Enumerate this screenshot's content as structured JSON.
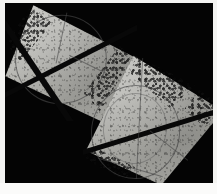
{
  "figure": {
    "domain": "natural-image",
    "width_px": 217,
    "height_px": 194
  },
  "colors": {
    "plate_background": "#f4f4f2",
    "field_background": "#040404",
    "specimen_light": "#c2c2bd",
    "specimen_mid": "#a9a9a4",
    "specimen_dark": "#8d8d88",
    "band_dark": "#080808",
    "outline_gray": "#4a4a4a",
    "caption_strip": "#fbfbfa"
  },
  "specimens": [
    {
      "id": "specimen-upper-left",
      "label": "Upper-left specimen",
      "shape": "kite",
      "bands": 2,
      "band_pattern": "crossing-x",
      "inner_structure": "circular-inclusion",
      "texture": "granular-speckled"
    },
    {
      "id": "specimen-lower-right",
      "label": "Lower-right specimen",
      "shape": "kite",
      "bands": 1,
      "band_pattern": "single-diagonal",
      "inner_structure": "circular-inclusion",
      "texture": "granular-speckled"
    }
  ],
  "caption": {
    "text": ""
  }
}
